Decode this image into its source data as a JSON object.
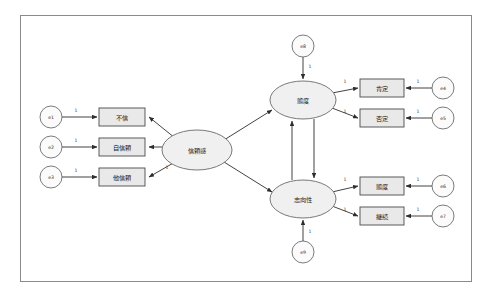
{
  "page": {
    "background": "#ffffff",
    "frame_color": "#8a8a8a"
  },
  "colors": {
    "rect_fill": "#e9e9e9",
    "ellipse_fill": "#f0f0f0",
    "error_fill": "#fbfbfb",
    "stroke": "#2e2e2e",
    "text": "#1a1a1a"
  },
  "diagram": {
    "type": "path-diagram",
    "latent_variables": [
      {
        "id": "trust",
        "label": "信頼感",
        "cx": 197,
        "cy": 150,
        "rx": 35,
        "ry": 20
      },
      {
        "id": "attitude",
        "label": "態度",
        "cx": 303,
        "cy": 100,
        "rx": 33,
        "ry": 19
      },
      {
        "id": "orientation",
        "label": "志向性",
        "cx": 303,
        "cy": 199,
        "rx": 33,
        "ry": 19
      }
    ],
    "observed_variables": [
      {
        "id": "obs1",
        "label": "不信",
        "x": 99,
        "y": 108,
        "w": 46,
        "h": 18
      },
      {
        "id": "obs2",
        "label": "自信頼",
        "x": 99,
        "y": 138,
        "w": 46,
        "h": 18
      },
      {
        "id": "obs3",
        "label": "他信頼",
        "x": 99,
        "y": 168,
        "w": 46,
        "h": 18
      },
      {
        "id": "obs4",
        "label": "肯定",
        "x": 360,
        "y": 79,
        "w": 44,
        "h": 18
      },
      {
        "id": "obs5",
        "label": "否定",
        "x": 360,
        "y": 109,
        "w": 44,
        "h": 18
      },
      {
        "id": "obs6",
        "label": "態度",
        "x": 360,
        "y": 177,
        "w": 44,
        "h": 18
      },
      {
        "id": "obs7",
        "label": "継続",
        "x": 360,
        "y": 207,
        "w": 44,
        "h": 18
      }
    ],
    "error_terms": [
      {
        "id": "e1",
        "label": "e1",
        "cx": 51,
        "cy": 117,
        "r": 11
      },
      {
        "id": "e2",
        "label": "e2",
        "cx": 51,
        "cy": 147,
        "r": 11
      },
      {
        "id": "e3",
        "label": "e3",
        "cx": 51,
        "cy": 177,
        "r": 11
      },
      {
        "id": "e4",
        "label": "e4",
        "cx": 443,
        "cy": 88,
        "r": 11
      },
      {
        "id": "e5",
        "label": "e5",
        "cx": 443,
        "cy": 118,
        "r": 11
      },
      {
        "id": "e6",
        "label": "e6",
        "cx": 443,
        "cy": 186,
        "r": 11
      },
      {
        "id": "e7",
        "label": "e7",
        "cx": 443,
        "cy": 216,
        "r": 11
      },
      {
        "id": "e8",
        "label": "e8",
        "cx": 303,
        "cy": 46,
        "r": 11
      },
      {
        "id": "e9",
        "label": "e9",
        "cx": 303,
        "cy": 252,
        "r": 11
      }
    ],
    "path_labels": [
      {
        "id": "p1",
        "value": "1",
        "x": 76,
        "y": 111
      },
      {
        "id": "p2",
        "value": "1",
        "x": 76,
        "y": 141
      },
      {
        "id": "p3",
        "value": "1",
        "x": 76,
        "y": 171
      },
      {
        "id": "p4",
        "value": "1",
        "x": 167,
        "y": 168
      },
      {
        "id": "p5",
        "value": "1",
        "x": 345,
        "y": 82
      },
      {
        "id": "p6",
        "value": "1",
        "x": 345,
        "y": 112
      },
      {
        "id": "p7",
        "value": "1",
        "x": 345,
        "y": 180
      },
      {
        "id": "p8",
        "value": "1",
        "x": 345,
        "y": 210
      },
      {
        "id": "p9",
        "value": "1",
        "x": 418,
        "y": 82
      },
      {
        "id": "p10",
        "value": "1",
        "x": 418,
        "y": 112
      },
      {
        "id": "p11",
        "value": "1",
        "x": 418,
        "y": 180
      },
      {
        "id": "p12",
        "value": "1",
        "x": 418,
        "y": 210
      },
      {
        "id": "p13",
        "value": "1",
        "x": 310,
        "y": 67
      },
      {
        "id": "p14",
        "value": "1",
        "x": 310,
        "y": 232
      }
    ],
    "edges": [
      {
        "from": "e1",
        "to": "obs1",
        "kind": "single"
      },
      {
        "from": "e2",
        "to": "obs2",
        "kind": "single"
      },
      {
        "from": "e3",
        "to": "obs3",
        "kind": "single"
      },
      {
        "from": "trust",
        "to": "obs1",
        "kind": "single"
      },
      {
        "from": "trust",
        "to": "obs2",
        "kind": "single"
      },
      {
        "from": "trust",
        "to": "obs3",
        "kind": "single"
      },
      {
        "from": "trust",
        "to": "attitude",
        "kind": "single"
      },
      {
        "from": "trust",
        "to": "orientation",
        "kind": "single"
      },
      {
        "from": "attitude",
        "to": "orientation",
        "kind": "single"
      },
      {
        "from": "orientation",
        "to": "attitude",
        "kind": "single"
      },
      {
        "from": "e8",
        "to": "attitude",
        "kind": "single"
      },
      {
        "from": "e9",
        "to": "orientation",
        "kind": "single"
      },
      {
        "from": "attitude",
        "to": "obs4",
        "kind": "single"
      },
      {
        "from": "attitude",
        "to": "obs5",
        "kind": "single"
      },
      {
        "from": "orientation",
        "to": "obs6",
        "kind": "single"
      },
      {
        "from": "orientation",
        "to": "obs7",
        "kind": "single"
      },
      {
        "from": "e4",
        "to": "obs4",
        "kind": "single"
      },
      {
        "from": "e5",
        "to": "obs5",
        "kind": "single"
      },
      {
        "from": "e6",
        "to": "obs6",
        "kind": "single"
      },
      {
        "from": "e7",
        "to": "obs7",
        "kind": "single"
      }
    ]
  }
}
